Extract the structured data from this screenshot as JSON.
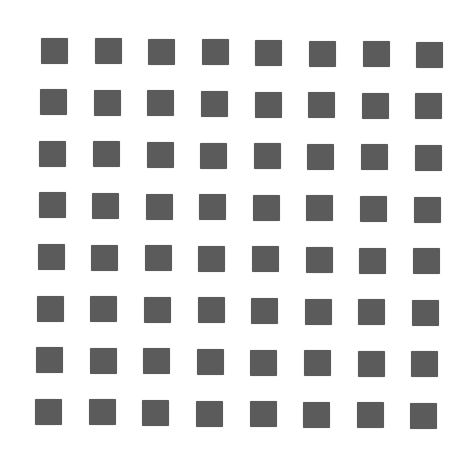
{
  "figure": {
    "rows": 8,
    "cols": 8,
    "square_color": "#5b5b5b",
    "background_color": "#ffffff",
    "square_size": 27,
    "origin": {
      "x": 41,
      "y": 37.5
    },
    "col_step": {
      "dx": 53.6,
      "dy": 0.6
    },
    "row_step": {
      "dx": -0.85,
      "dy": 51.6
    }
  }
}
